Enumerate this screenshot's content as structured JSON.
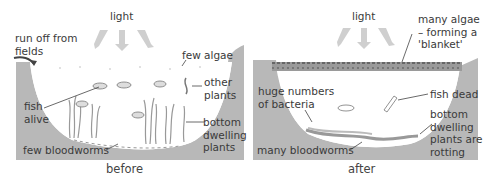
{
  "figure": {
    "panels": [
      {
        "id": "before",
        "caption": "before",
        "labels": {
          "light": "light",
          "runoff": "run off from\nfields",
          "algae": "few algae",
          "other_plants": "other\nplants",
          "fish": "fish\nalive",
          "bottom_plants": "bottom\ndwelling\nplants",
          "bloodworms": "few bloodworms"
        }
      },
      {
        "id": "after",
        "caption": "after",
        "labels": {
          "light": "light",
          "algae": "many algae\n– forming a\n'blanket'",
          "bacteria": "huge numbers\nof bacteria",
          "fish": "fish dead",
          "bottom_plants": "bottom\ndwelling\nplants are\nrotting",
          "bloodworms": "many bloodworms"
        }
      }
    ],
    "colors": {
      "bank": "#b5b5b5",
      "water": "#ffffff",
      "arrow": "#c8c8c8",
      "line": "#555555",
      "algae_blanket": "#8a8a8a"
    }
  }
}
